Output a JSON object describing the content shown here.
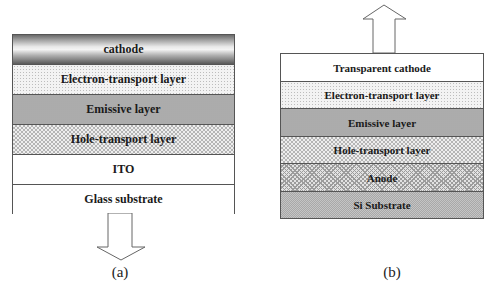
{
  "panels": [
    {
      "id": "a",
      "label": "(a)",
      "emission_direction": "down",
      "layers": [
        {
          "name": "cathode",
          "fill": "metallic-gradient"
        },
        {
          "name": "Electron-transport layer",
          "fill": "light-dots"
        },
        {
          "name": "Emissive layer",
          "fill": "medium-dots"
        },
        {
          "name": "Hole-transport layer",
          "fill": "grid-dots"
        },
        {
          "name": "ITO",
          "fill": "white"
        },
        {
          "name": "Glass substrate",
          "fill": "white"
        }
      ]
    },
    {
      "id": "b",
      "label": "(b)",
      "emission_direction": "up",
      "layers": [
        {
          "name": "Transparent cathode",
          "fill": "white"
        },
        {
          "name": "Electron-transport layer",
          "fill": "light-dots"
        },
        {
          "name": "Emissive layer",
          "fill": "medium-dots"
        },
        {
          "name": "Hole-transport layer",
          "fill": "grid-dots"
        },
        {
          "name": "Anode",
          "fill": "crosshatch"
        },
        {
          "name": "Si Substrate",
          "fill": "dense-dots"
        }
      ]
    }
  ],
  "colors": {
    "border": "#555555",
    "text": "#1a1a1a",
    "arrow_stroke": "#666666"
  }
}
